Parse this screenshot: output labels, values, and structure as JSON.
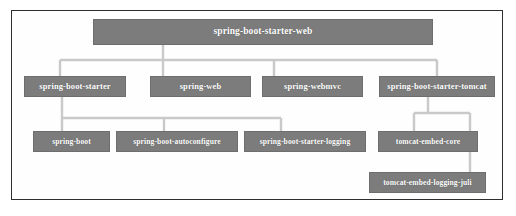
{
  "figure": {
    "kind": "dependency-tree-diagram",
    "colors": {
      "node_fill": "#7c7c7c",
      "node_border": "#6e6e6e",
      "node_text": "#ffffff",
      "connector": "#c9c9c9",
      "frame_border": "#2e2e2e",
      "background": "#ffffff"
    }
  },
  "nodes": {
    "root": {
      "label": "spring-boot-starter-web",
      "x": 93,
      "y": 19,
      "w": 340,
      "h": 26
    },
    "level1": [
      {
        "label": "spring-boot-starter",
        "x": 24,
        "y": 76,
        "w": 102,
        "h": 21
      },
      {
        "label": "spring-web",
        "x": 150,
        "y": 76,
        "w": 101,
        "h": 21
      },
      {
        "label": "spring-webmvc",
        "x": 262,
        "y": 76,
        "w": 101,
        "h": 21
      },
      {
        "label": "spring-boot-starter-tomcat",
        "x": 379,
        "y": 76,
        "w": 116,
        "h": 21
      }
    ],
    "level2": [
      {
        "label": "spring-boot",
        "x": 33,
        "y": 131,
        "w": 77,
        "h": 21
      },
      {
        "label": "spring-boot-autoconfigure",
        "x": 116,
        "y": 131,
        "w": 122,
        "h": 21
      },
      {
        "label": "spring-boot-starter-logging",
        "x": 244,
        "y": 131,
        "w": 122,
        "h": 21
      },
      {
        "label": "tomcat-embed-core",
        "x": 378,
        "y": 131,
        "w": 100,
        "h": 21
      }
    ],
    "level3": [
      {
        "label": "tomcat-embed-logging-juli",
        "x": 369,
        "y": 172,
        "w": 117,
        "h": 21
      }
    ]
  },
  "connectors": {
    "root_to_level1": {
      "stem_x": 163,
      "stem_top": 45,
      "bus_y": 60,
      "bus_left": 60,
      "bus_right": 437,
      "drops_x": [
        60,
        163,
        274,
        437
      ],
      "drop_bottom": 76
    },
    "starter_to_level2": {
      "stem_x": 62,
      "stem_top": 97,
      "bus_y": 118,
      "bus_left": 62,
      "bus_right": 281,
      "drops_x": [
        62,
        164,
        281
      ],
      "drop_bottom": 131
    },
    "tomcat_to_children": {
      "stem_x": 428,
      "stem_top": 97,
      "bus_y": 113,
      "bus_left": 414,
      "bus_right": 470,
      "core_drop_x": 414,
      "core_drop_bottom": 131,
      "juli_drop_x": 470,
      "juli_drop_bottom": 172
    }
  }
}
